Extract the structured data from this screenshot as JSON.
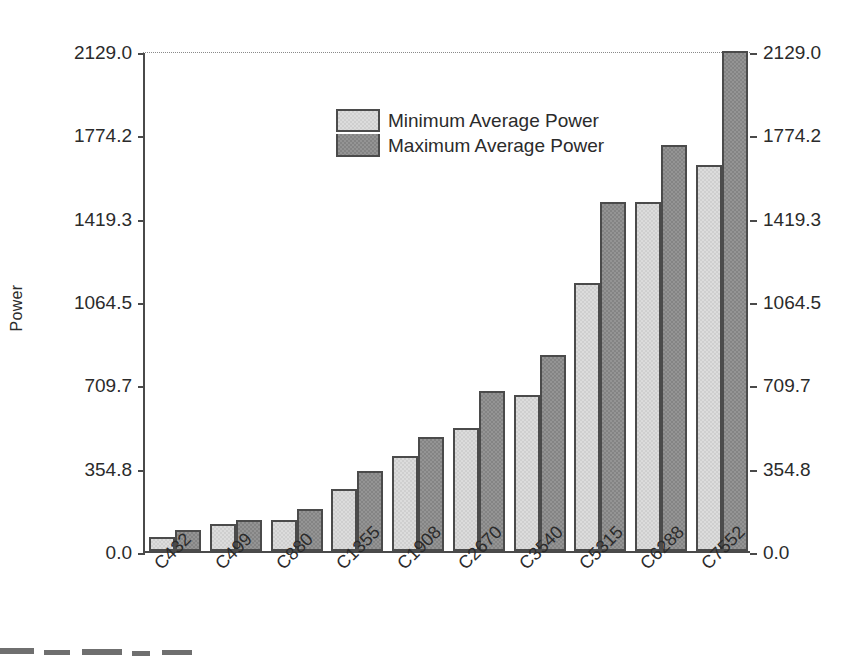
{
  "chart_data": {
    "type": "bar",
    "title": "",
    "xlabel": "",
    "ylabel": "Power",
    "ylim": [
      0.0,
      2129.0
    ],
    "grid": false,
    "legend_position": "upper-center",
    "y_ticks": [
      "0.0",
      "354.8",
      "709.7",
      "1064.5",
      "1419.3",
      "1774.2",
      "2129.0"
    ],
    "y_tick_values": [
      0.0,
      354.8,
      709.7,
      1064.5,
      1419.3,
      1774.2,
      2129.0
    ],
    "right_axis_ticks": [
      "0.0",
      "354.8",
      "709.7",
      "1064.5",
      "1419.3",
      "1774.2",
      "2129.0"
    ],
    "categories": [
      "C432",
      "C499",
      "C880",
      "C1355",
      "C1908",
      "C2670",
      "C3540",
      "C5315",
      "C6288",
      "C7552"
    ],
    "series": [
      {
        "name": "Minimum Average Power",
        "color": "#dcdcdc",
        "values": [
          59,
          115,
          132,
          266,
          404,
          523,
          664,
          1140,
          1487,
          1644
        ]
      },
      {
        "name": "Maximum Average Power",
        "color": "#949494",
        "values": [
          89,
          132,
          181,
          339,
          485,
          681,
          833,
          1487,
          1727,
          2129
        ]
      }
    ]
  },
  "axis": {
    "y_label": "Power"
  },
  "legend": {
    "items": [
      {
        "label": "Minimum Average Power"
      },
      {
        "label": "Maximum Average Power"
      }
    ]
  }
}
